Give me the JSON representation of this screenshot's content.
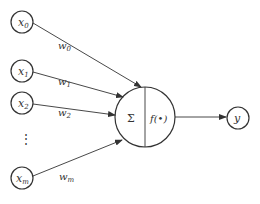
{
  "diagram": {
    "type": "perceptron / artificial neuron",
    "inputs": [
      {
        "label": "x",
        "sub": "0",
        "weight": "w",
        "wsub": "0"
      },
      {
        "label": "x",
        "sub": "1",
        "weight": "w",
        "wsub": "1"
      },
      {
        "label": "x",
        "sub": "2",
        "weight": "w",
        "wsub": "2"
      },
      {
        "label": "x",
        "sub": "m",
        "weight": "w",
        "wsub": "m"
      }
    ],
    "ellipsis": "⋮",
    "neuron": {
      "sum_symbol": "Σ",
      "activation": "f(•)"
    },
    "output": {
      "label": "y"
    },
    "colors": {
      "stroke": "#333333",
      "background": "#ffffff"
    }
  }
}
